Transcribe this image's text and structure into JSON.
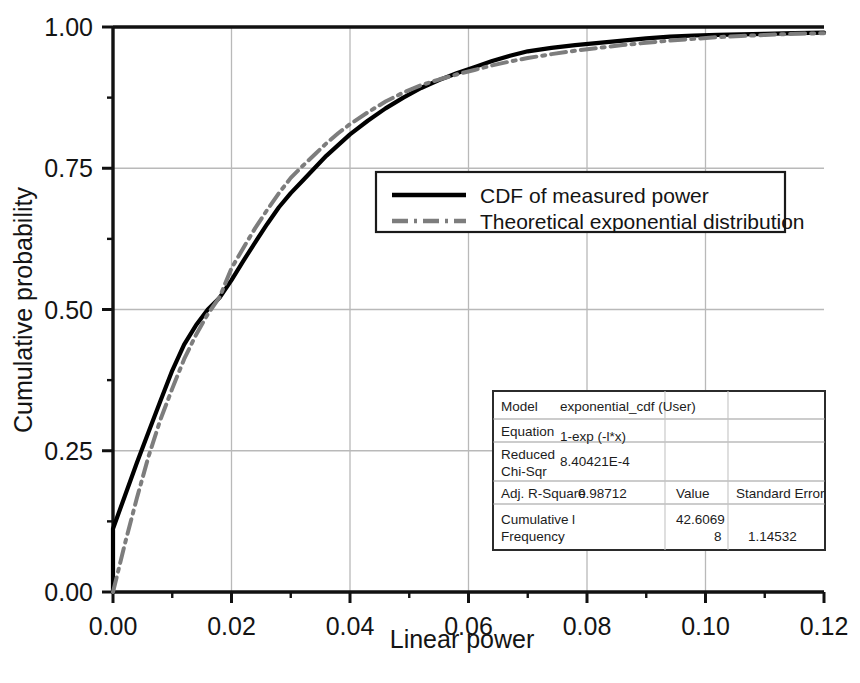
{
  "chart_data": {
    "type": "line",
    "title": "",
    "xlabel": "Linear power",
    "ylabel": "Cumulative probability",
    "xlim": [
      0.0,
      0.12
    ],
    "ylim": [
      0.0,
      1.0
    ],
    "xticks": [
      "0.00",
      "0.02",
      "0.04",
      "0.06",
      "0.08",
      "0.10",
      "0.12"
    ],
    "xtick_values": [
      0.0,
      0.02,
      0.04,
      0.06,
      0.08,
      0.1,
      0.12
    ],
    "yticks": [
      "0.00",
      "0.25",
      "0.50",
      "0.75",
      "1.00"
    ],
    "ytick_values": [
      0.0,
      0.25,
      0.5,
      0.75,
      1.0
    ],
    "minor_tick_interval_x": 0.01,
    "minor_tick_interval_y": 0.125,
    "grid": true,
    "grid_color": "#b9b9b9",
    "legend_position": "upper center",
    "series": [
      {
        "name": "CDF of measured power",
        "style": "solid",
        "color": "#000000",
        "width": 4.2,
        "points": [
          [
            0.0,
            0.0
          ],
          [
            0.0,
            0.112
          ],
          [
            0.002,
            0.17
          ],
          [
            0.004,
            0.228
          ],
          [
            0.006,
            0.283
          ],
          [
            0.008,
            0.338
          ],
          [
            0.01,
            0.392
          ],
          [
            0.012,
            0.438
          ],
          [
            0.014,
            0.472
          ],
          [
            0.016,
            0.5
          ],
          [
            0.018,
            0.521
          ],
          [
            0.02,
            0.552
          ],
          [
            0.022,
            0.586
          ],
          [
            0.024,
            0.619
          ],
          [
            0.026,
            0.651
          ],
          [
            0.028,
            0.681
          ],
          [
            0.03,
            0.706
          ],
          [
            0.032,
            0.728
          ],
          [
            0.034,
            0.75
          ],
          [
            0.036,
            0.772
          ],
          [
            0.038,
            0.791
          ],
          [
            0.04,
            0.81
          ],
          [
            0.043,
            0.834
          ],
          [
            0.046,
            0.856
          ],
          [
            0.049,
            0.875
          ],
          [
            0.052,
            0.892
          ],
          [
            0.055,
            0.906
          ],
          [
            0.058,
            0.918
          ],
          [
            0.061,
            0.929
          ],
          [
            0.064,
            0.94
          ],
          [
            0.067,
            0.949
          ],
          [
            0.07,
            0.957
          ],
          [
            0.074,
            0.963
          ],
          [
            0.078,
            0.968
          ],
          [
            0.082,
            0.972
          ],
          [
            0.086,
            0.976
          ],
          [
            0.09,
            0.98
          ],
          [
            0.094,
            0.983
          ],
          [
            0.098,
            0.985
          ],
          [
            0.102,
            0.986
          ],
          [
            0.106,
            0.987
          ],
          [
            0.11,
            0.988
          ],
          [
            0.115,
            0.989
          ],
          [
            0.12,
            0.99
          ]
        ]
      },
      {
        "name": "Theoretical exponential distribution",
        "style": "dashdot",
        "color": "#7d7d7d",
        "width": 4.0,
        "points": [
          [
            0.0,
            0.0
          ],
          [
            0.002,
            0.085
          ],
          [
            0.004,
            0.165
          ],
          [
            0.006,
            0.24
          ],
          [
            0.008,
            0.305
          ],
          [
            0.01,
            0.36
          ],
          [
            0.012,
            0.412
          ],
          [
            0.014,
            0.455
          ],
          [
            0.016,
            0.492
          ],
          [
            0.018,
            0.522
          ],
          [
            0.02,
            0.573
          ],
          [
            0.022,
            0.609
          ],
          [
            0.024,
            0.644
          ],
          [
            0.026,
            0.676
          ],
          [
            0.028,
            0.706
          ],
          [
            0.03,
            0.733
          ],
          [
            0.032,
            0.754
          ],
          [
            0.034,
            0.774
          ],
          [
            0.036,
            0.794
          ],
          [
            0.038,
            0.812
          ],
          [
            0.04,
            0.828
          ],
          [
            0.043,
            0.849
          ],
          [
            0.046,
            0.868
          ],
          [
            0.049,
            0.884
          ],
          [
            0.052,
            0.897
          ],
          [
            0.055,
            0.907
          ],
          [
            0.058,
            0.916
          ],
          [
            0.061,
            0.924
          ],
          [
            0.064,
            0.932
          ],
          [
            0.067,
            0.939
          ],
          [
            0.07,
            0.945
          ],
          [
            0.074,
            0.952
          ],
          [
            0.078,
            0.958
          ],
          [
            0.082,
            0.963
          ],
          [
            0.086,
            0.968
          ],
          [
            0.09,
            0.972
          ],
          [
            0.094,
            0.976
          ],
          [
            0.098,
            0.979
          ],
          [
            0.102,
            0.982
          ],
          [
            0.106,
            0.984
          ],
          [
            0.11,
            0.986
          ],
          [
            0.115,
            0.988
          ],
          [
            0.12,
            0.989
          ]
        ]
      }
    ]
  },
  "legend": {
    "items": [
      {
        "label": "CDF of measured power",
        "style": "solid",
        "color": "#000000"
      },
      {
        "label": "Theoretical exponential distribution",
        "style": "dashdot",
        "color": "#7d7d7d"
      }
    ]
  },
  "stats_table": {
    "rows": [
      {
        "label": "Model",
        "value": "exponential_cdf (User)",
        "col3": "",
        "col4": ""
      },
      {
        "label": "Equation",
        "value": "1-exp (-l*x)",
        "col3": "",
        "col4": ""
      },
      {
        "label": "Reduced\nChi-Sqr",
        "label_line1": "Reduced",
        "label_line2": "Chi-Sqr",
        "value": "8.40421E-4",
        "col3": "",
        "col4": ""
      },
      {
        "label": "Adj. R-Square",
        "value": "0.98712",
        "col3": "",
        "col4": ""
      }
    ],
    "header_value": "Value",
    "header_std_error": "Standard Error",
    "param_row": {
      "label_line1": "Cumulative",
      "label_line2": "Frequency",
      "param": "l",
      "value_line1": "42.6069",
      "value_line2": "8",
      "std_error": "1.14532"
    }
  }
}
